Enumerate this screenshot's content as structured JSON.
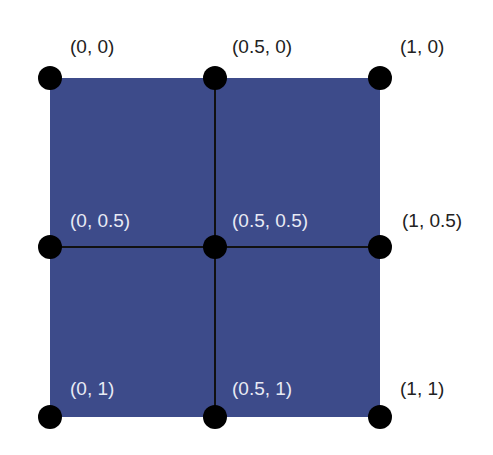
{
  "diagram": {
    "fill_color": "#3d4b8a",
    "points": [
      {
        "label": "(0, 0)"
      },
      {
        "label": "(0.5, 0)"
      },
      {
        "label": "(1, 0)"
      },
      {
        "label": "(0, 0.5)"
      },
      {
        "label": "(0.5, 0.5)"
      },
      {
        "label": "(1, 0.5)"
      },
      {
        "label": "(0, 1)"
      },
      {
        "label": "(0.5, 1)"
      },
      {
        "label": "(1, 1)"
      }
    ]
  }
}
